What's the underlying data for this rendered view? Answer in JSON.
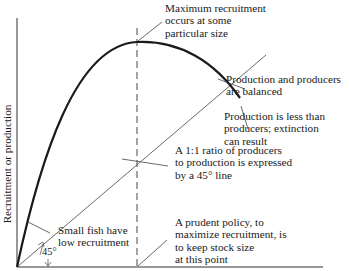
{
  "diagram": {
    "y_axis_label": "Recruitment or production",
    "angle_label": "45°",
    "annotations": {
      "max_recruitment": [
        "Maximum recruitment",
        "occurs at some",
        "particular size"
      ],
      "balanced": [
        "Production and producers",
        "are balanced"
      ],
      "extinction": [
        "Production is less than",
        "producers; extinction",
        "can result"
      ],
      "ratio_line": [
        "A 1:1 ratio of producers",
        "to production is expressed",
        "by a 45° line"
      ],
      "small_fish": [
        "Small fish have",
        "low recruitment"
      ],
      "prudent_policy": [
        "A prudent policy, to",
        "maximize recruitment, is",
        "to keep stock size",
        "at this point"
      ]
    },
    "colors": {
      "ink": "#1a1a1a",
      "thin_line": "#444444",
      "background": "#ffffff"
    }
  }
}
